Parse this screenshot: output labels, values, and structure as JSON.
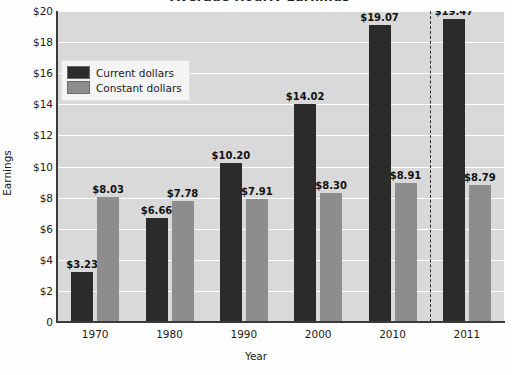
{
  "chart_data": {
    "type": "bar",
    "title": "Average Hourly Earnings",
    "xlabel": "Year",
    "ylabel": "Earnings",
    "ylim": [
      0,
      20
    ],
    "ytick_values": [
      0,
      2,
      4,
      6,
      8,
      10,
      12,
      14,
      16,
      18,
      20
    ],
    "ytick_labels": [
      "0",
      "$2",
      "$4",
      "$6",
      "$8",
      "$10",
      "$12",
      "$14",
      "$16",
      "$18",
      "$20"
    ],
    "categories": [
      "1970",
      "1980",
      "1990",
      "2000",
      "2010",
      "2011"
    ],
    "grid": "horizontal",
    "legend_position": "upper-left",
    "series": [
      {
        "name": "Current dollars",
        "color": "#2b2b2b",
        "values": [
          3.23,
          6.66,
          10.2,
          14.02,
          19.07,
          19.47
        ],
        "labels": [
          "$3.23",
          "$6.66",
          "$10.20",
          "$14.02",
          "$19.07",
          "$19.47"
        ]
      },
      {
        "name": "Constant dollars",
        "color": "#8d8d8d",
        "values": [
          8.03,
          7.78,
          7.91,
          8.3,
          8.91,
          8.79
        ],
        "labels": [
          "$8.03",
          "$7.78",
          "$7.91",
          "$8.30",
          "$8.91",
          "$8.79"
        ]
      }
    ],
    "annotations": [
      {
        "name": "projection-divider",
        "type": "vertical-dashed-line",
        "after_category": "2010"
      }
    ]
  },
  "legend": {
    "items": [
      {
        "label": "Current dollars"
      },
      {
        "label": "Constant dollars"
      }
    ]
  }
}
